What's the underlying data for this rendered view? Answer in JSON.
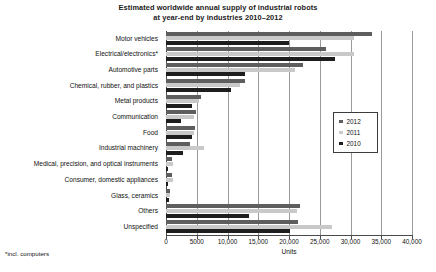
{
  "title": {
    "line1": "Estimated worldwide annual supply of industrial robots",
    "line2": "at year-end  by industries 2010–2012"
  },
  "footnote": "*incl. computers",
  "axis": {
    "x_title": "Units",
    "x_ticks": [
      "0",
      "5000",
      "10,000",
      "15,000",
      "20,000",
      "25,000",
      "30,000",
      "35,000",
      "40,000"
    ]
  },
  "legend": {
    "items": [
      {
        "label": "2012",
        "color": "#5e5e5e"
      },
      {
        "label": "2011",
        "color": "#c9c9c9"
      },
      {
        "label": "2010",
        "color": "#1e1e1e"
      }
    ]
  },
  "chart_data": {
    "type": "bar",
    "orientation": "horizontal",
    "title": "Estimated worldwide annual supply of industrial robots at year-end  by industries 2010–2012",
    "xlabel": "Units",
    "ylabel": "",
    "xlim": [
      0,
      40000
    ],
    "xticks": [
      0,
      5000,
      10000,
      15000,
      20000,
      25000,
      30000,
      35000,
      40000
    ],
    "grid": "vertical",
    "legend_position": "right",
    "categories": [
      "Motor vehicles",
      "Electrical/electronics*",
      "Automotive parts",
      "Chemical, rubber, and plastics",
      "Metal products",
      "Communication",
      "Food",
      "Industrial machinery",
      "Medical, precision, and optical instruments",
      "Consumer, domestic appliances",
      "Glass, ceramics",
      "Others",
      "Unspecified"
    ],
    "series": [
      {
        "name": "2012",
        "color": "#5e5e5e",
        "values": [
          33500,
          26000,
          22300,
          12900,
          5700,
          4800,
          4700,
          3900,
          900,
          900,
          600,
          21800,
          21500
        ]
      },
      {
        "name": "2011",
        "color": "#c9c9c9",
        "values": [
          30600,
          30500,
          20900,
          12100,
          5400,
          4500,
          4600,
          6100,
          1100,
          1100,
          700,
          21300,
          27000
        ]
      },
      {
        "name": "2010",
        "color": "#1e1e1e",
        "values": [
          20000,
          27500,
          12900,
          10500,
          4300,
          2400,
          4200,
          2700,
          400,
          400,
          500,
          13500,
          20200
        ]
      }
    ]
  }
}
